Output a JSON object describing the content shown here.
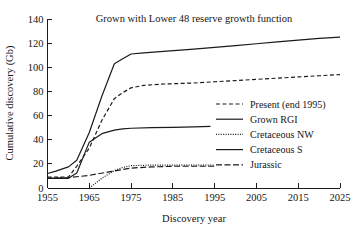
{
  "chart_data": {
    "type": "line",
    "title": "Grown with Lower 48 reserve growth function",
    "xlabel": "Discovery year",
    "ylabel": "Cumulative discovery (Gb)",
    "xlim": [
      1955,
      2025
    ],
    "ylim": [
      0,
      140
    ],
    "xticks": [
      1955,
      1965,
      1975,
      1985,
      1995,
      2005,
      2015,
      2025
    ],
    "xtick_labels": [
      "1955",
      "1965",
      "1975",
      "1985",
      "1995",
      "2005",
      "2015",
      "2025"
    ],
    "yticks": [
      0,
      20,
      40,
      60,
      80,
      100,
      120,
      140
    ],
    "ytick_labels": [
      "0",
      "20",
      "40",
      "60",
      "80",
      "100",
      "120",
      "140"
    ],
    "grid": false,
    "legend_position": "center-right",
    "line_color": "#1a1a1a",
    "series": [
      {
        "name": "Present (end 1995)",
        "style": "dashed",
        "dasharray": "4,2.5",
        "width": 1.2,
        "x": [
          1955,
          1957,
          1960,
          1962,
          1965,
          1968,
          1971,
          1973,
          1975,
          1978,
          1982,
          1986,
          1990,
          1995,
          2000,
          2005,
          2010,
          2015,
          2020,
          2025
        ],
        "y": [
          9,
          9,
          9,
          18,
          33,
          56,
          74,
          79,
          83,
          85,
          86,
          86.5,
          87,
          88,
          89,
          90,
          91,
          92,
          93,
          94
        ]
      },
      {
        "name": "Grown RGI",
        "style": "solid",
        "dasharray": "",
        "width": 1.2,
        "x": [
          1955,
          1957,
          1960,
          1962,
          1965,
          1968,
          1971,
          1973,
          1975,
          1978,
          1982,
          1986,
          1990,
          1995,
          2000,
          2005,
          2010,
          2015,
          2020,
          2025
        ],
        "y": [
          12,
          14,
          17.5,
          23,
          46,
          76,
          103,
          107,
          111,
          112,
          113,
          114,
          115,
          116.5,
          118,
          119.5,
          121,
          122.5,
          124,
          125
        ]
      },
      {
        "name": "Cretaceous NW",
        "style": "dotted",
        "dasharray": "1,1.4",
        "width": 1.2,
        "x": [
          1965,
          1968,
          1971,
          1973,
          1975,
          1980,
          1985,
          1990,
          1995
        ],
        "y": [
          0,
          8,
          14.5,
          17,
          18.5,
          19,
          19,
          19,
          19
        ]
      },
      {
        "name": "Cretaceous S",
        "style": "solid",
        "dasharray": "",
        "width": 1.2,
        "x": [
          1955,
          1958,
          1960,
          1962,
          1965,
          1968,
          1971,
          1973,
          1975,
          1980,
          1985,
          1990,
          1994
        ],
        "y": [
          8,
          8,
          8,
          12.5,
          38,
          45,
          48,
          49,
          49.5,
          50,
          50.3,
          50.7,
          51
        ]
      },
      {
        "name": "Jurassic",
        "style": "dashdash",
        "dasharray": "6,2.5",
        "width": 1.2,
        "x": [
          1955,
          1960,
          1965,
          1970,
          1975,
          1980,
          1985,
          1990,
          1995
        ],
        "y": [
          8,
          8.5,
          10.5,
          13.5,
          16.5,
          17.5,
          18,
          18,
          18
        ]
      }
    ]
  },
  "legend": {
    "entries": [
      {
        "label": "Present (end 1995)"
      },
      {
        "label": "Grown RGI"
      },
      {
        "label": "Cretaceous NW"
      },
      {
        "label": "Cretaceous S"
      },
      {
        "label": "Jurassic"
      }
    ]
  }
}
